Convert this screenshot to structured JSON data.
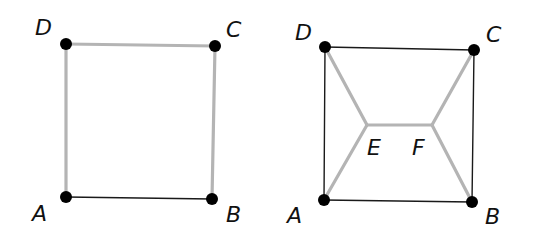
{
  "figures": [
    {
      "name": "square-path",
      "vertices": {
        "A": {
          "label": "A",
          "x": 66,
          "y": 197,
          "lx": 32,
          "ly": 221
        },
        "B": {
          "label": "B",
          "x": 212,
          "y": 199,
          "lx": 226,
          "ly": 222
        },
        "C": {
          "label": "C",
          "x": 215,
          "y": 46,
          "lx": 226,
          "ly": 37
        },
        "D": {
          "label": "D",
          "x": 66,
          "y": 44,
          "lx": 35,
          "ly": 35
        }
      },
      "gray_edges": [
        [
          "A",
          "D"
        ],
        [
          "D",
          "C"
        ],
        [
          "C",
          "B"
        ]
      ],
      "black_edges": [
        [
          "A",
          "B"
        ]
      ]
    },
    {
      "name": "steiner-network",
      "vertices": {
        "A": {
          "label": "A",
          "x": 324,
          "y": 200,
          "lx": 287,
          "ly": 223
        },
        "B": {
          "label": "B",
          "x": 472,
          "y": 202,
          "lx": 485,
          "ly": 224
        },
        "C": {
          "label": "C",
          "x": 474,
          "y": 50,
          "lx": 486,
          "ly": 42
        },
        "D": {
          "label": "D",
          "x": 325,
          "y": 47,
          "lx": 295,
          "ly": 40
        },
        "E": {
          "label": "E",
          "x": 367,
          "y": 125,
          "lx": 367,
          "ly": 155
        },
        "F": {
          "label": "F",
          "x": 432,
          "y": 125,
          "lx": 412,
          "ly": 155
        }
      },
      "gray_edges": [
        [
          "D",
          "E"
        ],
        [
          "A",
          "E"
        ],
        [
          "E",
          "F"
        ],
        [
          "F",
          "C"
        ],
        [
          "F",
          "B"
        ]
      ],
      "black_edges": [
        [
          "D",
          "C"
        ],
        [
          "D",
          "A"
        ],
        [
          "A",
          "B"
        ],
        [
          "C",
          "B"
        ]
      ],
      "steiner_points": [
        "E",
        "F"
      ]
    }
  ],
  "colors": {
    "gray_edge": "#b4b4b4",
    "black_edge": "#1a1a1a",
    "vertex": "#000000"
  }
}
